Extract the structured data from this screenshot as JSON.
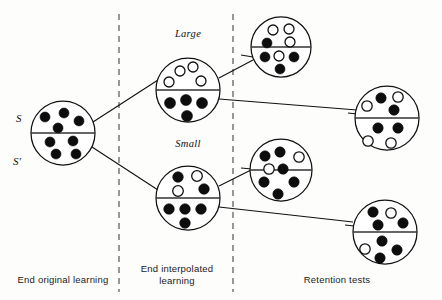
{
  "figure": {
    "title_bottom_labels": [
      {
        "text": "End original learning",
        "x": 63,
        "y": 283,
        "anchor": "middle"
      },
      {
        "text": "End interpolated",
        "x": 177,
        "y": 272,
        "anchor": "middle"
      },
      {
        "text": "learning",
        "x": 177,
        "y": 284,
        "anchor": "middle"
      },
      {
        "text": "Retention tests",
        "x": 337,
        "y": 283,
        "anchor": "middle"
      }
    ],
    "set_labels": [
      {
        "text": "S",
        "x": 16,
        "y": 122
      },
      {
        "text": "S'",
        "x": 13,
        "y": 165
      }
    ],
    "condition_labels": [
      {
        "text": "Large",
        "x": 188,
        "y": 37,
        "anchor": "middle"
      },
      {
        "text": "Small",
        "x": 188,
        "y": 147,
        "anchor": "middle"
      }
    ],
    "separators": [
      {
        "name": "sep-original-interpolated",
        "x": 119,
        "y1": 14,
        "y2": 292
      },
      {
        "name": "sep-interpolated-retention",
        "x": 233,
        "y1": 14,
        "y2": 292
      }
    ],
    "connectors": [
      {
        "name": "orig-to-large",
        "x1": 93,
        "y1": 122,
        "x2": 158,
        "y2": 80
      },
      {
        "name": "orig-to-small",
        "x1": 92,
        "y1": 147,
        "x2": 158,
        "y2": 190
      },
      {
        "name": "large-to-top-retention",
        "x1": 219,
        "y1": 78,
        "x2": 253,
        "y2": 60
      },
      {
        "name": "large-to-right-retention",
        "x1": 219,
        "y1": 99,
        "x2": 357,
        "y2": 110
      },
      {
        "name": "small-to-mid-retention",
        "x1": 219,
        "y1": 186,
        "x2": 251,
        "y2": 170
      },
      {
        "name": "small-to-bottom-retention",
        "x1": 219,
        "y1": 207,
        "x2": 353,
        "y2": 222
      },
      {
        "name": "top-retention-stub",
        "x1": 241,
        "y1": 55,
        "x2": 253,
        "y2": 57
      },
      {
        "name": "right-retention-stub",
        "x1": 348,
        "y1": 113,
        "x2": 357,
        "y2": 114
      },
      {
        "name": "mid-retention-stub",
        "x1": 241,
        "y1": 168,
        "x2": 252,
        "y2": 169
      },
      {
        "name": "bottom-retention-stub",
        "x1": 345,
        "y1": 225,
        "x2": 354,
        "y2": 226
      }
    ],
    "circles": [
      {
        "name": "circle-end-original-learning",
        "cx": 63,
        "cy": 133,
        "r": 32,
        "upper_items": [
          {
            "type": "filled",
            "dx": -18,
            "dy": -16,
            "r": 5.0
          },
          {
            "type": "filled",
            "dx": 1,
            "dy": -20,
            "r": 5.0
          },
          {
            "type": "filled",
            "dx": -5,
            "dy": -5,
            "r": 5.0
          },
          {
            "type": "filled",
            "dx": 16,
            "dy": -12,
            "r": 5.0
          }
        ],
        "lower_items": [
          {
            "type": "filled",
            "dx": -13,
            "dy": 9,
            "r": 5.0
          },
          {
            "type": "filled",
            "dx": 10,
            "dy": 8,
            "r": 5.0
          },
          {
            "type": "filled",
            "dx": -7,
            "dy": 21,
            "r": 5.0
          },
          {
            "type": "filled",
            "dx": 13,
            "dy": 21,
            "r": 5.0
          }
        ]
      },
      {
        "name": "circle-interpolated-large",
        "cx": 188,
        "cy": 90,
        "r": 32,
        "upper_items": [
          {
            "type": "open",
            "dx": -19,
            "dy": -8,
            "r": 5.0
          },
          {
            "type": "open",
            "dx": -8,
            "dy": -19,
            "r": 5.0
          },
          {
            "type": "open",
            "dx": 5,
            "dy": -23,
            "r": 5.0
          },
          {
            "type": "open",
            "dx": 13,
            "dy": -9,
            "r": 5.0
          }
        ],
        "lower_items": [
          {
            "type": "filled",
            "dx": -18,
            "dy": 13,
            "r": 5.5
          },
          {
            "type": "filled",
            "dx": -2,
            "dy": 10,
            "r": 5.5
          },
          {
            "type": "filled",
            "dx": 14,
            "dy": 13,
            "r": 5.5
          },
          {
            "type": "filled",
            "dx": -1,
            "dy": 26,
            "r": 5.5
          }
        ]
      },
      {
        "name": "circle-interpolated-small",
        "cx": 188,
        "cy": 198,
        "r": 32,
        "upper_items": [
          {
            "type": "filled",
            "dx": -10,
            "dy": -21,
            "r": 5.3
          },
          {
            "type": "open",
            "dx": 9,
            "dy": -22,
            "r": 5.3
          },
          {
            "type": "open",
            "dx": -10,
            "dy": -7,
            "r": 5.3
          },
          {
            "type": "filled",
            "dx": 16,
            "dy": -9,
            "r": 5.3
          }
        ],
        "lower_items": [
          {
            "type": "filled",
            "dx": -19,
            "dy": 11,
            "r": 5.3
          },
          {
            "type": "filled",
            "dx": -3,
            "dy": 11,
            "r": 5.3
          },
          {
            "type": "filled",
            "dx": 13,
            "dy": 11,
            "r": 5.3
          },
          {
            "type": "filled",
            "dx": -3,
            "dy": 25,
            "r": 5.3
          }
        ]
      },
      {
        "name": "circle-retention-large-first",
        "cx": 281,
        "cy": 47,
        "r": 30,
        "upper_items": [
          {
            "type": "open",
            "dx": -8,
            "dy": -17,
            "r": 5.0
          },
          {
            "type": "open",
            "dx": 8,
            "dy": -18,
            "r": 5.0
          },
          {
            "type": "open",
            "dx": 9,
            "dy": -5,
            "r": 5.0
          },
          {
            "type": "filled",
            "dx": -14,
            "dy": -4,
            "r": 5.0
          }
        ],
        "lower_items": [
          {
            "type": "filled",
            "dx": -16,
            "dy": 10,
            "r": 5.0
          },
          {
            "type": "open",
            "dx": -2,
            "dy": 9,
            "r": 5.0
          },
          {
            "type": "filled",
            "dx": 13,
            "dy": 10,
            "r": 5.0
          },
          {
            "type": "filled",
            "dx": -1,
            "dy": 22,
            "r": 5.0
          }
        ]
      },
      {
        "name": "circle-retention-large-second",
        "cx": 387,
        "cy": 118,
        "r": 32,
        "upper_items": [
          {
            "type": "filled",
            "dx": -6,
            "dy": -20,
            "r": 5.2
          },
          {
            "type": "open",
            "dx": 11,
            "dy": -21,
            "r": 5.2
          },
          {
            "type": "open",
            "dx": -20,
            "dy": -12,
            "r": 5.2
          },
          {
            "type": "filled",
            "dx": 7,
            "dy": -8,
            "r": 5.2
          }
        ],
        "lower_items": [
          {
            "type": "filled",
            "dx": -9,
            "dy": 10,
            "r": 5.2
          },
          {
            "type": "filled",
            "dx": 11,
            "dy": 10,
            "r": 5.2
          },
          {
            "type": "open",
            "dx": -19,
            "dy": 23,
            "r": 5.2
          },
          {
            "type": "open",
            "dx": 4,
            "dy": 25,
            "r": 5.2
          }
        ]
      },
      {
        "name": "circle-retention-small-first",
        "cx": 281,
        "cy": 170,
        "r": 31,
        "upper_items": [
          {
            "type": "filled",
            "dx": -16,
            "dy": -14,
            "r": 5.2
          },
          {
            "type": "filled",
            "dx": -1,
            "dy": -18,
            "r": 5.2
          },
          {
            "type": "open",
            "dx": 18,
            "dy": -13,
            "r": 5.2
          },
          {
            "type": "open",
            "dx": -12,
            "dy": -1,
            "r": 5.2
          }
        ],
        "lower_items": [
          {
            "type": "filled",
            "dx": 2,
            "dy": -1,
            "r": 5.2
          },
          {
            "type": "filled",
            "dx": -17,
            "dy": 12,
            "r": 5.2
          },
          {
            "type": "filled",
            "dx": 13,
            "dy": 12,
            "r": 5.2
          },
          {
            "type": "filled",
            "dx": -3,
            "dy": 24,
            "r": 5.2
          }
        ]
      },
      {
        "name": "circle-retention-small-second",
        "cx": 385,
        "cy": 232,
        "r": 32,
        "upper_items": [
          {
            "type": "filled",
            "dx": -12,
            "dy": -20,
            "r": 5.2
          },
          {
            "type": "open",
            "dx": 6,
            "dy": -19,
            "r": 5.2
          },
          {
            "type": "filled",
            "dx": -7,
            "dy": -7,
            "r": 5.2
          },
          {
            "type": "filled",
            "dx": 18,
            "dy": -9,
            "r": 5.2
          }
        ],
        "lower_items": [
          {
            "type": "filled",
            "dx": -3,
            "dy": 9,
            "r": 5.2
          },
          {
            "type": "open",
            "dx": -20,
            "dy": 17,
            "r": 5.2
          },
          {
            "type": "filled",
            "dx": 12,
            "dy": 18,
            "r": 5.2
          },
          {
            "type": "filled",
            "dx": -5,
            "dy": 26,
            "r": 5.2
          }
        ]
      }
    ],
    "colors": {
      "filled": "#0d0d0d",
      "open_stroke": "#111111",
      "line": "#111111",
      "dashed": "#555555",
      "background": "#fdfdfb"
    }
  }
}
